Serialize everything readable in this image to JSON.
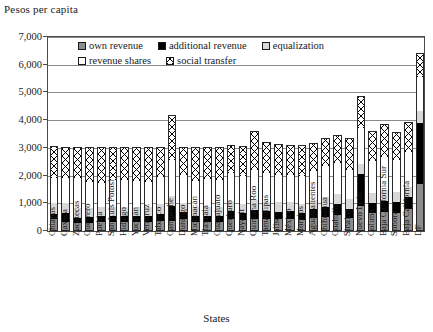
{
  "chart_data": {
    "type": "bar",
    "subtype": "stacked-vertical",
    "title": "",
    "ylabel": "Pesos per capita",
    "xlabel": "States",
    "ylim": [
      0,
      7000
    ],
    "yticks": [
      0,
      1000,
      2000,
      3000,
      4000,
      5000,
      6000,
      7000
    ],
    "ytick_labels": [
      "0",
      "1,000",
      "2,000",
      "3,000",
      "4,000",
      "5,000",
      "6,000",
      "7,000"
    ],
    "grid": true,
    "legend_position": "top-inside",
    "categories": [
      "Chiapas",
      "Oaxaca",
      "Zacatecas",
      "Guerrero",
      "Puebla",
      "San Luis Potosí",
      "Hidalgo",
      "Yucatán",
      "Veracruz",
      "Tabasco",
      "Campeche",
      "Durango",
      "Michoacán",
      "Tlaxcala",
      "Guanajuato",
      "Querétaro",
      "Nayarit",
      "Quintana Roo",
      "Tamaulipas",
      "Jalisco",
      "México",
      "Morelos",
      "Aguascalientes",
      "Chihuahua",
      "Coahuila",
      "Sinaloa",
      "Nuevo León",
      "Colima",
      "Baja California Sur",
      "Sonora",
      "Baja California",
      "DF"
    ],
    "series": [
      {
        "name": "own revenue",
        "color": "#8d8d8d",
        "values": [
          420,
          330,
          300,
          300,
          330,
          330,
          330,
          340,
          330,
          360,
          360,
          420,
          330,
          330,
          330,
          420,
          380,
          420,
          420,
          420,
          420,
          400,
          480,
          520,
          560,
          480,
          900,
          640,
          680,
          660,
          800,
          1700
        ]
      },
      {
        "name": "additional revenue",
        "color": "#000000",
        "values": [
          200,
          330,
          180,
          200,
          200,
          220,
          200,
          200,
          220,
          260,
          560,
          260,
          220,
          200,
          220,
          300,
          260,
          340,
          300,
          280,
          300,
          260,
          300,
          360,
          400,
          320,
          1150,
          360,
          400,
          400,
          420,
          2200
        ]
      },
      {
        "name": "equalization",
        "color": "#d8d8d8",
        "values": [
          380,
          360,
          340,
          320,
          320,
          330,
          330,
          320,
          320,
          340,
          340,
          340,
          320,
          330,
          320,
          340,
          340,
          360,
          340,
          330,
          320,
          330,
          340,
          360,
          360,
          340,
          360,
          380,
          400,
          360,
          380,
          420
        ]
      },
      {
        "name": "revenue shares",
        "color": "#ffffff",
        "values": [
          900,
          900,
          1100,
          950,
          900,
          950,
          980,
          950,
          900,
          1000,
          1300,
          1000,
          950,
          1000,
          980,
          1050,
          1000,
          1100,
          1050,
          1000,
          980,
          1000,
          1050,
          1100,
          1150,
          1050,
          1300,
          1150,
          1200,
          1150,
          1250,
          1250
        ]
      },
      {
        "name": "social transfer",
        "color": "#ffffff",
        "pattern": "cross-hatch",
        "values": [
          1180,
          1130,
          1120,
          1280,
          1280,
          1190,
          1180,
          1210,
          1260,
          1080,
          1620,
          1020,
          1200,
          1160,
          1180,
          1000,
          1080,
          1400,
          1100,
          1120,
          1100,
          1130,
          1010,
          1000,
          980,
          1150,
          1160,
          1080,
          1180,
          1000,
          1070,
          870
        ]
      }
    ],
    "totals": [
      3080,
      3050,
      3040,
      3050,
      3030,
      3020,
      3020,
      3020,
      3030,
      3040,
      4180,
      3040,
      3020,
      3020,
      3030,
      3110,
      3060,
      3620,
      3210,
      3150,
      3120,
      3120,
      3180,
      3340,
      3450,
      3340,
      4870,
      3610,
      3860,
      3570,
      3920,
      6440
    ]
  },
  "legend": {
    "rows": [
      [
        {
          "label": "own revenue",
          "swatch": "own-revenue-swatch"
        },
        {
          "label": "additional revenue",
          "swatch": "additional-revenue-swatch"
        },
        {
          "label": "equalization",
          "swatch": "equalization-swatch"
        }
      ],
      [
        {
          "label": "revenue shares",
          "swatch": "revenue-shares-swatch"
        },
        {
          "label": "social transfer",
          "swatch": "social-transfer-swatch"
        }
      ]
    ]
  }
}
